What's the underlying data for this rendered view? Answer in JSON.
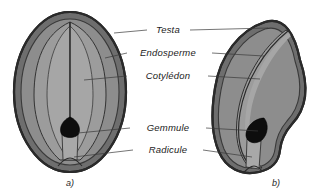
{
  "figure": {
    "background_color": "#ffffff",
    "width": 335,
    "height": 194
  },
  "labels": [
    {
      "id": "testa",
      "text": "Testa",
      "x": 168,
      "y": 33
    },
    {
      "id": "endosperme",
      "text": "Endosperme",
      "x": 168,
      "y": 56
    },
    {
      "id": "cotyledon",
      "text": "Cotylédon",
      "x": 168,
      "y": 79
    },
    {
      "id": "gemmule",
      "text": "Gemmule",
      "x": 168,
      "y": 131
    },
    {
      "id": "radicule",
      "text": "Radicule",
      "x": 168,
      "y": 153
    }
  ],
  "captions": [
    {
      "id": "caption-a",
      "text": "a)",
      "x": 70,
      "y": 186
    },
    {
      "id": "caption-b",
      "text": "b)",
      "x": 276,
      "y": 186
    }
  ],
  "colors": {
    "testa_band": "#6e6e6e",
    "testa_outline": "#262626",
    "endosperm": "#8d8d8d",
    "cotyledon": "#9a9a9a",
    "gemmule": "#0d0d0d",
    "radicule": "#a5a5a5",
    "leader_line": "#3a3a3a",
    "text": "#1c1c1c",
    "background": "#ffffff"
  },
  "specimens": [
    {
      "id": "seed-a",
      "caption": "a)",
      "shape": "oval",
      "description": "Graine ovale en coupe longitudinale avec deux cotylédons symétriques",
      "parts": [
        "testa",
        "endosperme",
        "cotyledon",
        "gemmule",
        "radicule"
      ]
    },
    {
      "id": "seed-b",
      "caption": "b)",
      "shape": "reniforme",
      "description": "Graine réniforme en coupe longitudinale avec cotylédon incurvé",
      "parts": [
        "testa",
        "endosperme",
        "cotyledon",
        "gemmule",
        "radicule"
      ]
    }
  ]
}
